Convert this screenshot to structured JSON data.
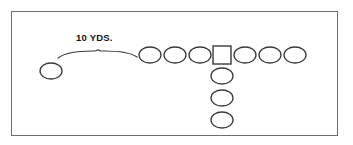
{
  "diagram": {
    "background_color": "#ffffff",
    "border_color": "#6e6e6e",
    "stroke_color": "#3a3a3a",
    "measurement": {
      "label": "10 YDS.",
      "label_x": 76,
      "label_y": 41,
      "brace": {
        "start_x": 58,
        "end_x": 137,
        "baseline_y": 58,
        "peak_x": 98,
        "peak_y": 50
      }
    },
    "shapes": {
      "oval_rx": 11,
      "oval_ry": 8,
      "square_size": 18
    },
    "players": [
      {
        "name": "split-receiver-left",
        "type": "oval",
        "cx": 51,
        "cy": 71
      },
      {
        "name": "line-oval-1",
        "type": "oval",
        "cx": 150,
        "cy": 55
      },
      {
        "name": "line-oval-2",
        "type": "oval",
        "cx": 175,
        "cy": 55
      },
      {
        "name": "line-oval-3",
        "type": "oval",
        "cx": 200,
        "cy": 55
      },
      {
        "name": "center-square",
        "type": "square",
        "cx": 222,
        "cy": 55
      },
      {
        "name": "line-oval-4",
        "type": "oval",
        "cx": 245,
        "cy": 55
      },
      {
        "name": "line-oval-5",
        "type": "oval",
        "cx": 270,
        "cy": 55
      },
      {
        "name": "line-oval-6",
        "type": "oval",
        "cx": 295,
        "cy": 55
      },
      {
        "name": "backfield-oval-1",
        "type": "oval",
        "cx": 222,
        "cy": 76
      },
      {
        "name": "backfield-oval-2",
        "type": "oval",
        "cx": 222,
        "cy": 98
      },
      {
        "name": "backfield-oval-3",
        "type": "oval",
        "cx": 222,
        "cy": 120
      }
    ]
  }
}
